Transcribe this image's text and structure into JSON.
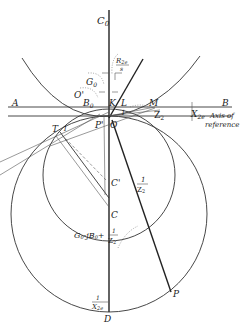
{
  "figure": {
    "type": "circle-diagram",
    "points": {
      "C0": "C",
      "C0_sub": "0",
      "A": "A",
      "B": "B",
      "O_prime": "O'",
      "B0": "B",
      "B0_sub": "0",
      "G0": "G",
      "G0_sub": "0",
      "K": "K",
      "L": "L",
      "M": "M",
      "O": "O",
      "P_prime": "P'",
      "T": "T",
      "C_prime": "C'",
      "C": "C",
      "P": "P",
      "D": "D",
      "one_near_T": "1",
      "one_near_O": "1"
    },
    "labels": {
      "R2e_over_s_num": "R",
      "R2e_over_s_num_sub": "2e",
      "R2e_over_s_den": "s",
      "Z2": "Z",
      "Z2_sub": "2",
      "X2e": "X",
      "X2e_sub": "2e",
      "axis_of_reference_line1": "Axis of",
      "axis_of_reference_line2": "reference",
      "one_over_Z2_num": "1",
      "one_over_Z2_den": "Z",
      "one_over_Z2_den_sub": "2",
      "admittance_expr": "G",
      "admittance_expr_sub0": "0",
      "admittance_expr_mid": "-jB",
      "admittance_expr_sub1": "0",
      "admittance_expr_plus": "+",
      "admittance_num": "1",
      "admittance_den": "Z",
      "admittance_den_sub": "2",
      "one_over_X2e_num": "1",
      "one_over_X2e_den": "X",
      "one_over_X2e_den_sub": "2e"
    }
  }
}
